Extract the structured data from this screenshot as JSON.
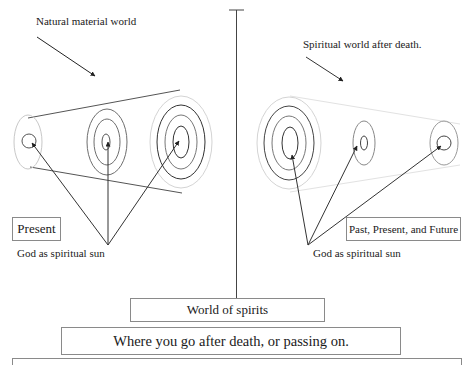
{
  "diagram": {
    "left": {
      "heading": "Natural material world",
      "time_label": "Present",
      "center_label": "God as spiritual sun"
    },
    "right": {
      "heading": "Spiritual world after death.",
      "time_label": "Past, Present, and Future",
      "center_label": "God as spiritual sun"
    },
    "bottom": {
      "world_box": "World of spirits",
      "description_box": "Where you go after death, or passing on.",
      "lower_box": ""
    },
    "colors": {
      "line_dark": "#333333",
      "line_mid": "#6e6e6e",
      "line_light": "#c8c8c8",
      "box_border": "#8a8a8a"
    }
  }
}
